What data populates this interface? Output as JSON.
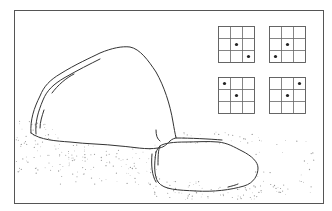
{
  "illustration": {
    "subject": "two boulders on stippled ground with four 3x3 dot grids",
    "frame": {
      "x": 14,
      "y": 10,
      "width": 309,
      "height": 193
    },
    "grids": [
      {
        "id": "top-left",
        "x": 218,
        "y": 26,
        "cell": 12,
        "dots": [
          [
            1,
            1
          ],
          [
            2,
            2
          ]
        ]
      },
      {
        "id": "top-right",
        "x": 269,
        "y": 26,
        "cell": 12,
        "dots": [
          [
            1,
            1
          ],
          [
            2,
            0
          ]
        ]
      },
      {
        "id": "bottom-left",
        "x": 218,
        "y": 77,
        "cell": 12,
        "dots": [
          [
            0,
            0
          ],
          [
            1,
            1
          ]
        ]
      },
      {
        "id": "bottom-right",
        "x": 269,
        "y": 77,
        "cell": 12,
        "dots": [
          [
            0,
            2
          ],
          [
            1,
            1
          ]
        ]
      }
    ],
    "colors": {
      "line": "#333333",
      "frame": "#555555",
      "stipple": "#999999",
      "background": "#ffffff"
    }
  }
}
